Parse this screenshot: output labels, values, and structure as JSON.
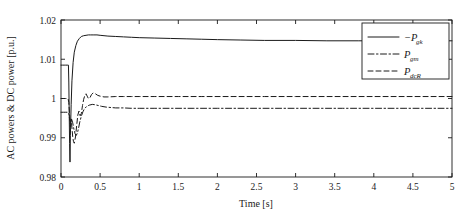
{
  "chart_data": {
    "type": "line",
    "title": "",
    "xlabel": "Time [s]",
    "ylabel": "AC powers & DC power [p.u.]",
    "xlim": [
      0,
      5
    ],
    "ylim": [
      0.98,
      1.02
    ],
    "xticks": [
      "0",
      "0.5",
      "1",
      "1.5",
      "2",
      "2.5",
      "3",
      "3.5",
      "4",
      "4.5",
      "5"
    ],
    "xtick_values": [
      0,
      0.5,
      1,
      1.5,
      2,
      2.5,
      3,
      3.5,
      4,
      4.5,
      5
    ],
    "yticks": [
      "0.98",
      "0.99",
      "1",
      "1.01",
      "1.02"
    ],
    "ytick_values": [
      0.98,
      0.99,
      1.0,
      1.01,
      1.02
    ],
    "grid": false,
    "legend_position": "upper right inside",
    "series": [
      {
        "name": "-P_gk",
        "label_main": "−P",
        "label_sub": "gk",
        "style": "solid",
        "x": [
          0,
          0.02,
          0.04,
          0.06,
          0.08,
          0.095,
          0.1,
          0.105,
          0.11,
          0.115,
          0.12,
          0.13,
          0.14,
          0.155,
          0.17,
          0.19,
          0.21,
          0.235,
          0.26,
          0.29,
          0.32,
          0.35,
          0.38,
          0.42,
          0.46,
          0.5,
          0.55,
          0.6,
          0.7,
          0.8,
          0.9,
          1.0,
          1.2,
          1.4,
          1.6,
          1.8,
          2.0,
          2.3,
          2.6,
          3.0,
          3.4,
          3.8,
          4.2,
          4.6,
          5.0
        ],
        "y": [
          1.0085,
          1.0085,
          1.0085,
          1.0085,
          1.0085,
          1.0085,
          1.0042,
          0.9962,
          0.9885,
          0.9838,
          0.9905,
          0.9985,
          1.0045,
          1.0092,
          1.0118,
          1.0135,
          1.0146,
          1.0153,
          1.0158,
          1.016,
          1.0161,
          1.0162,
          1.0162,
          1.0162,
          1.0162,
          1.0161,
          1.016,
          1.0159,
          1.0158,
          1.0157,
          1.0156,
          1.0155,
          1.0154,
          1.0153,
          1.0152,
          1.0151,
          1.015,
          1.0149,
          1.0148,
          1.0148,
          1.0147,
          1.0147,
          1.0147,
          1.0147,
          1.0147
        ]
      },
      {
        "name": "P_gm",
        "label_main": "P",
        "label_sub": "gm",
        "style": "dashdot",
        "x": [
          0,
          0.03,
          0.06,
          0.09,
          0.1,
          0.11,
          0.12,
          0.135,
          0.15,
          0.165,
          0.18,
          0.195,
          0.21,
          0.225,
          0.24,
          0.26,
          0.28,
          0.3,
          0.33,
          0.36,
          0.4,
          0.44,
          0.48,
          0.52,
          0.58,
          0.64,
          0.7,
          0.8,
          0.9,
          1.0,
          1.2,
          1.4,
          1.7,
          2.0,
          2.4,
          2.8,
          3.2,
          3.6,
          4.0,
          4.4,
          5.0
        ],
        "y": [
          0.9965,
          0.9965,
          0.9965,
          0.9965,
          0.9962,
          0.9948,
          0.9935,
          0.9948,
          0.9938,
          0.9922,
          0.991,
          0.9906,
          0.9912,
          0.9925,
          0.994,
          0.9955,
          0.9966,
          0.9974,
          0.998,
          0.9983,
          0.9985,
          0.9984,
          0.9982,
          0.998,
          0.9978,
          0.9977,
          0.9976,
          0.9976,
          0.9975,
          0.9975,
          0.9975,
          0.9975,
          0.9975,
          0.9975,
          0.9975,
          0.9975,
          0.9975,
          0.9975,
          0.9975,
          0.9975,
          0.9975
        ]
      },
      {
        "name": "P_dcR",
        "label_main": "P",
        "label_sub": "dcR",
        "style": "dashed",
        "x": [
          0,
          0.03,
          0.06,
          0.09,
          0.1,
          0.11,
          0.12,
          0.13,
          0.14,
          0.15,
          0.16,
          0.17,
          0.185,
          0.2,
          0.215,
          0.23,
          0.245,
          0.26,
          0.275,
          0.29,
          0.305,
          0.32,
          0.335,
          0.35,
          0.37,
          0.39,
          0.41,
          0.44,
          0.47,
          0.5,
          0.55,
          0.6,
          0.7,
          0.8,
          0.9,
          1.0,
          1.2,
          1.5,
          1.8,
          2.2,
          2.6,
          3.0,
          3.5,
          4.0,
          4.5,
          5.0
        ],
        "y": [
          1.0,
          1.0,
          1.0,
          1.0,
          0.999,
          0.996,
          0.9928,
          0.9948,
          0.9925,
          0.9902,
          0.989,
          0.9886,
          0.9902,
          0.993,
          0.9958,
          0.9968,
          0.9956,
          0.9962,
          0.9982,
          0.9998,
          1.0008,
          1.0012,
          1.0006,
          1.0,
          1.0002,
          1.001,
          1.0014,
          1.0012,
          1.0008,
          1.0006,
          1.0004,
          1.0004,
          1.0005,
          1.0005,
          1.0005,
          1.0005,
          1.0005,
          1.0005,
          1.0005,
          1.0005,
          1.0005,
          1.0005,
          1.0005,
          1.0005,
          1.0005,
          1.0005
        ]
      }
    ]
  },
  "legend": {
    "entries": [
      {
        "label_main": "−P",
        "label_sub": "gk",
        "style": "solid"
      },
      {
        "label_main": "P",
        "label_sub": "gm",
        "style": "dashdot"
      },
      {
        "label_main": "P",
        "label_sub": "dcR",
        "style": "dashed"
      }
    ]
  }
}
